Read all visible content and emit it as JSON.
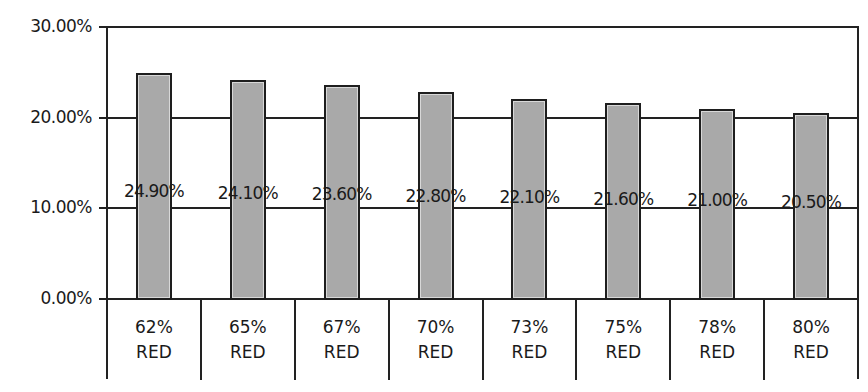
{
  "chart_data": {
    "type": "bar",
    "title": "",
    "xlabel": "",
    "ylabel": "",
    "categories": [
      "62% RED",
      "65% RED",
      "67% RED",
      "70% RED",
      "73% RED",
      "75% RED",
      "78% RED",
      "80% RED"
    ],
    "category_lines": [
      [
        "62%",
        "RED"
      ],
      [
        "65%",
        "RED"
      ],
      [
        "67%",
        "RED"
      ],
      [
        "70%",
        "RED"
      ],
      [
        "73%",
        "RED"
      ],
      [
        "75%",
        "RED"
      ],
      [
        "78%",
        "RED"
      ],
      [
        "80%",
        "RED"
      ]
    ],
    "values": [
      24.9,
      24.1,
      23.6,
      22.8,
      22.1,
      21.6,
      21.0,
      20.5
    ],
    "data_labels": [
      "24.90%",
      "24.10%",
      "23.60%",
      "22.80%",
      "22.10%",
      "21.60%",
      "21.00%",
      "20.50%"
    ],
    "ylim": [
      0,
      30
    ],
    "yticks": [
      0,
      10,
      20,
      30
    ],
    "ytick_labels": [
      "0.00%",
      "10.00%",
      "20.00%",
      "30.00%"
    ],
    "grid": true,
    "legend": null,
    "colors": {
      "bar_fill": "#a9a9a9",
      "bar_border": "#1e1e1e",
      "grid": "#222222"
    },
    "x_axis_style": "data table cells below plot"
  }
}
